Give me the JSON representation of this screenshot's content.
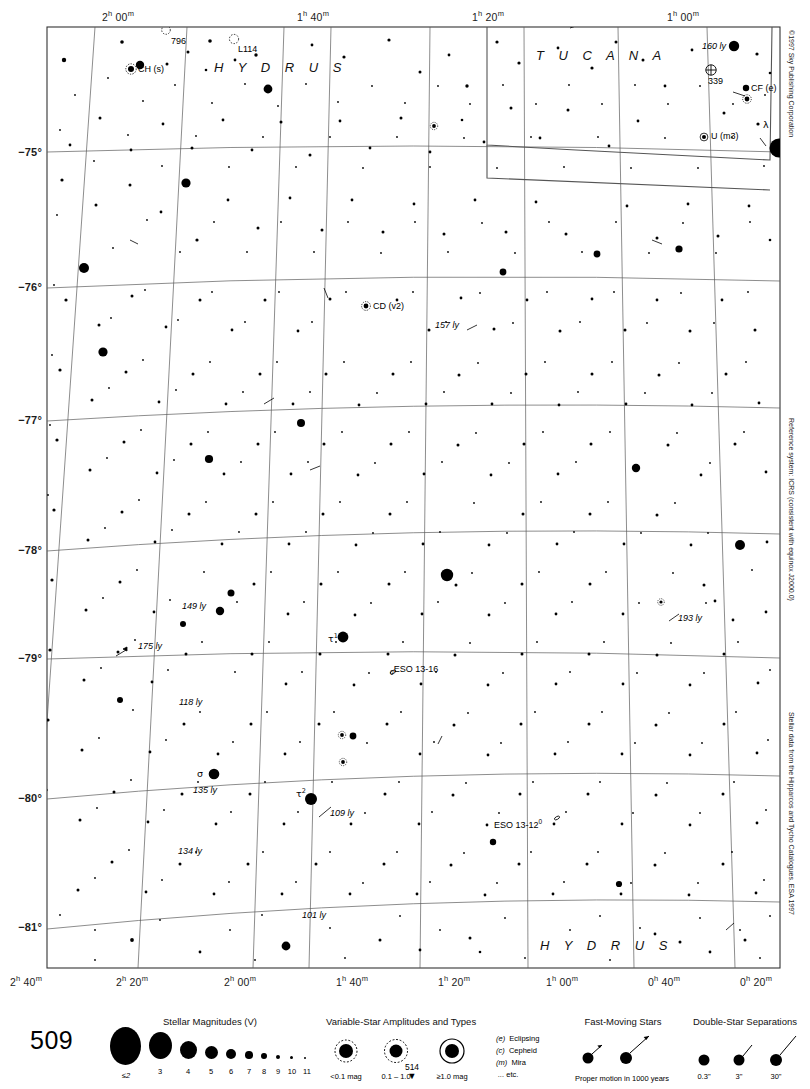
{
  "chart": {
    "number": "509",
    "next_chart": "514",
    "next_arrow": "▼",
    "copyright": "©1997 Sky Publishing Corporation",
    "reference_note": "Reference system: ICRS (consistent with equinox J2000.0)",
    "data_note": "Stellar data from the Hipparcos and Tycho Catalogues, ESA 1997"
  },
  "axes": {
    "ra_top": [
      {
        "label": "2",
        "unit_h": "h",
        "min": "00",
        "unit_m": "m",
        "x": 123
      },
      {
        "label": "1",
        "unit_h": "h",
        "min": "40",
        "unit_m": "m",
        "x": 318
      },
      {
        "label": "1",
        "unit_h": "h",
        "min": "20",
        "unit_m": "m",
        "x": 492
      },
      {
        "label": "1",
        "unit_h": "h",
        "min": "00",
        "unit_m": "m",
        "x": 688
      }
    ],
    "ra_bottom": [
      {
        "label": "2",
        "unit_h": "h",
        "min": "40",
        "unit_m": "m",
        "x": 26
      },
      {
        "label": "2",
        "unit_h": "h",
        "min": "20",
        "unit_m": "m",
        "x": 133
      },
      {
        "label": "2",
        "unit_h": "h",
        "min": "00",
        "unit_m": "m",
        "x": 240
      },
      {
        "label": "1",
        "unit_h": "h",
        "min": "40",
        "unit_m": "m",
        "x": 353
      },
      {
        "label": "1",
        "unit_h": "h",
        "min": "20",
        "unit_m": "m",
        "x": 455
      },
      {
        "label": "1",
        "unit_h": "h",
        "min": "00",
        "unit_m": "m",
        "x": 563
      },
      {
        "label": "0",
        "unit_h": "h",
        "min": "40",
        "unit_m": "m",
        "x": 665
      },
      {
        "label": "0",
        "unit_h": "h",
        "min": "20",
        "unit_m": "m",
        "x": 755
      }
    ],
    "dec_left": [
      {
        "label": "−75°",
        "y": 146
      },
      {
        "label": "−76°",
        "y": 284
      },
      {
        "label": "−77°",
        "y": 417
      },
      {
        "label": "−78°",
        "y": 546
      },
      {
        "label": "−79°",
        "y": 654
      },
      {
        "label": "−80°",
        "y": 794
      },
      {
        "label": "−81°",
        "y": 925
      }
    ]
  },
  "constellations": [
    {
      "name": "H Y D R U S",
      "x": 214,
      "y": 64
    },
    {
      "name": "T U C A N A",
      "x": 536,
      "y": 52
    },
    {
      "name": "H Y D R U S",
      "x": 540,
      "y": 944
    }
  ],
  "objects": [
    {
      "id": "796",
      "label": "796",
      "x": 172,
      "y": 40,
      "style": "plain"
    },
    {
      "id": "L114",
      "label": "L114",
      "x": 238,
      "y": 48,
      "style": "plain"
    },
    {
      "id": "CH",
      "label": "CH (s)",
      "x": 137,
      "y": 64,
      "style": "ital-paren"
    },
    {
      "id": "160ly",
      "label": "160 ly",
      "x": 707,
      "y": 45,
      "style": "ital"
    },
    {
      "id": "339",
      "label": "339",
      "x": 709,
      "y": 81,
      "style": "plain"
    },
    {
      "id": "CF",
      "label": "CF (e)",
      "x": 752,
      "y": 88,
      "style": "ital-paren"
    },
    {
      "id": "U",
      "label": "U (m3)",
      "x": 712,
      "y": 136,
      "style": "ital-paren"
    },
    {
      "id": "lambda",
      "label": "λ",
      "x": 764,
      "y": 124,
      "style": "greek"
    },
    {
      "id": "CD",
      "label": "CD (v2)",
      "x": 371,
      "y": 304,
      "style": "ital-paren"
    },
    {
      "id": "157ly",
      "label": "157 ly",
      "x": 437,
      "y": 324,
      "style": "ital"
    },
    {
      "id": "sigma",
      "label": "σ",
      "x": 198,
      "y": 774,
      "style": "greek"
    },
    {
      "id": "135ly",
      "label": "135 ly",
      "x": 196,
      "y": 793,
      "style": "ital"
    },
    {
      "id": "149ly",
      "label": "149 ly",
      "x": 183,
      "y": 606,
      "style": "ital"
    },
    {
      "id": "175ly",
      "label": "175 ly",
      "x": 139,
      "y": 646,
      "style": "ital"
    },
    {
      "id": "118ly",
      "label": "118 ly",
      "x": 180,
      "y": 702,
      "style": "ital"
    },
    {
      "id": "193ly",
      "label": "193 ly",
      "x": 677,
      "y": 617,
      "style": "ital"
    },
    {
      "id": "tau1",
      "label": "τ",
      "sup": "1",
      "x": 329,
      "y": 636,
      "style": "greek-sup"
    },
    {
      "id": "ESO13-16",
      "label": "ESO 13-16",
      "x": 397,
      "y": 668,
      "style": "eso",
      "prefix": "0"
    },
    {
      "id": "tau2",
      "label": "τ",
      "sup": "2",
      "x": 297,
      "y": 792,
      "style": "greek-sup"
    },
    {
      "id": "109ly",
      "label": "109 ly",
      "x": 330,
      "y": 812,
      "style": "ital"
    },
    {
      "id": "ESO13-12",
      "label": "ESO 13-12",
      "x": 497,
      "y": 822,
      "style": "eso",
      "suffix": "0"
    },
    {
      "id": "134ly",
      "label": "134 ly",
      "x": 180,
      "y": 851,
      "style": "ital"
    },
    {
      "id": "101ly",
      "label": "101 ly",
      "x": 303,
      "y": 914,
      "style": "ital"
    }
  ],
  "legend": {
    "magnitudes": {
      "title": "Stellar Magnitudes (V)",
      "labels": [
        "≤2",
        "3",
        "4",
        "5",
        "6",
        "7",
        "8",
        "9",
        "10",
        "11"
      ],
      "radii": [
        15.5,
        11.5,
        8.5,
        6.5,
        5.0,
        3.8,
        2.9,
        2.1,
        1.5,
        1.0
      ]
    },
    "variables": {
      "title": "Variable-Star Amplitudes and Types",
      "amplitudes": [
        "<0.1 mag",
        "0.1 – 1.0",
        "≥1.0 mag"
      ],
      "types": [
        {
          "code": "(e)",
          "name": "Eclipsing"
        },
        {
          "code": "(c)",
          "name": "Cepheid"
        },
        {
          "code": "(m)",
          "name": "Mira"
        },
        {
          "code": "...",
          "name": "etc."
        }
      ]
    },
    "fast_moving": {
      "title": "Fast-Moving Stars",
      "caption": "Proper motion in 1000 years"
    },
    "double_stars": {
      "title": "Double-Star Separations",
      "labels": [
        "0.3\"",
        "3\"",
        "30\""
      ]
    }
  }
}
